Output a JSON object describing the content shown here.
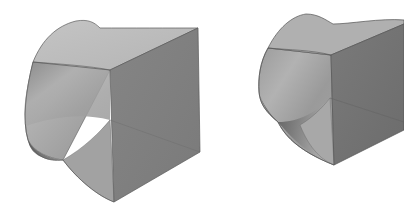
{
  "image": {
    "description": "Two rendered 3D solids: a square-to-curved transition block (left) and a variant with a waisted, flared curved face (right)",
    "background": "#ffffff",
    "shapes": [
      {
        "name": "left-solid",
        "faces": {
          "top": "#b4b4b4",
          "curved_side": "#a6a6a6",
          "front_right": "#7e7e7e",
          "lower_curve": "#9a9a9a",
          "edge": "#5a5a5a"
        }
      },
      {
        "name": "right-solid",
        "faces": {
          "top": "#b0b0b0",
          "curved_side": "#a0a0a0",
          "front_right": "#737373",
          "lower_curve": "#949494",
          "edge": "#555555"
        }
      }
    ]
  }
}
